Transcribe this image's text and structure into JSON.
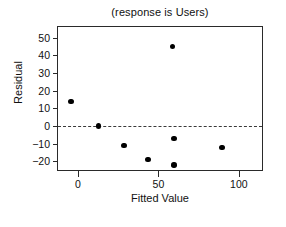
{
  "chart_data": {
    "type": "scatter",
    "title": "(response is Users)",
    "xlabel": "Fitted Value",
    "ylabel": "Residual",
    "xlim": [
      -13,
      115
    ],
    "ylim": [
      -26,
      56
    ],
    "xticks": [
      0,
      50,
      100
    ],
    "xtick_labels": [
      "0",
      "50",
      "100"
    ],
    "yticks": [
      -20,
      -10,
      0,
      10,
      20,
      30,
      40,
      50
    ],
    "ytick_labels": [
      "−20",
      "−10",
      "0",
      "10",
      "20",
      "30",
      "40",
      "50"
    ],
    "grid": false,
    "legend": null,
    "reference_line": {
      "orientation": "horizontal",
      "value": 0,
      "style": "dashed",
      "color": "#3a3a3a"
    },
    "marker": {
      "shape": "circle",
      "filled": true,
      "color": "#000000",
      "size_px": 5.4
    },
    "points": [
      {
        "x": -5,
        "y": 14
      },
      {
        "x": 12,
        "y": 0
      },
      {
        "x": 28,
        "y": -11
      },
      {
        "x": 43,
        "y": -19
      },
      {
        "x": 58,
        "y": 45
      },
      {
        "x": 59,
        "y": -7
      },
      {
        "x": 59,
        "y": -22
      },
      {
        "x": 89,
        "y": -12
      },
      {
        "x": 122,
        "y": 9
      }
    ],
    "x_values": [
      -5,
      12,
      28,
      43,
      58,
      59,
      59,
      89,
      122
    ],
    "y_values": [
      14,
      0,
      -11,
      -19,
      45,
      -7,
      -22,
      -12,
      9
    ]
  },
  "colors": {
    "axis": "#2a2a2a",
    "text": "#111111",
    "marker": "#000000",
    "reference_line": "#3a3a3a",
    "background": "#ffffff"
  }
}
